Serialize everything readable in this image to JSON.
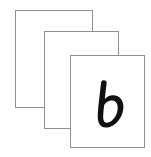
{
  "scene": {
    "title": "Flashcard stack",
    "background_color": "#ffffff",
    "card_face_color": "#ffffff",
    "card_border_color": "#8f9093",
    "glyph_color": "#111111"
  },
  "cards": [
    {
      "id": "card-back",
      "position": "back",
      "label": "",
      "face_color": "#ffffff",
      "border_color": "#8f9093"
    },
    {
      "id": "card-middle",
      "position": "middle",
      "label": "",
      "face_color": "#ffffff",
      "border_color": "#8f9093"
    },
    {
      "id": "card-front",
      "position": "front",
      "label": "b",
      "letter_case": "lowercase",
      "letter_style": "handwritten-bold",
      "face_color": "#ffffff",
      "border_color": "#8f9093",
      "glyph_color": "#111111"
    }
  ]
}
